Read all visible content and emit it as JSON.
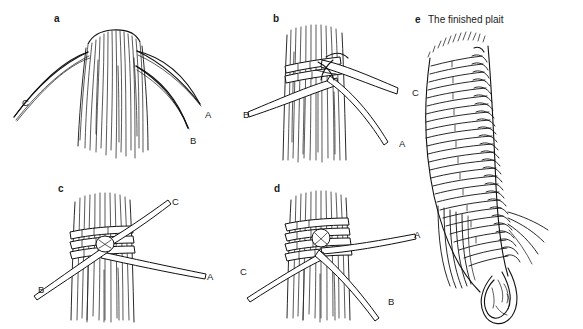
{
  "figure": {
    "background_color": "#ffffff",
    "ink_color": "#111111",
    "type": "instructional-line-drawing"
  },
  "panels": [
    {
      "id": "a",
      "letter": "a",
      "title": "",
      "labels": [
        {
          "text": "C",
          "x": 22,
          "y": 98
        },
        {
          "text": "A",
          "x": 205,
          "y": 110
        },
        {
          "text": "B",
          "x": 190,
          "y": 136
        }
      ]
    },
    {
      "id": "b",
      "letter": "b",
      "title": "",
      "labels": [
        {
          "text": "B",
          "x": 243,
          "y": 110
        },
        {
          "text": "C",
          "x": 412,
          "y": 88
        },
        {
          "text": "A",
          "x": 399,
          "y": 139
        }
      ]
    },
    {
      "id": "c",
      "letter": "c",
      "title": "",
      "labels": [
        {
          "text": "C",
          "x": 172,
          "y": 197
        },
        {
          "text": "A",
          "x": 207,
          "y": 272
        },
        {
          "text": "B",
          "x": 38,
          "y": 285
        }
      ]
    },
    {
      "id": "d",
      "letter": "d",
      "title": "",
      "labels": [
        {
          "text": "A",
          "x": 414,
          "y": 236
        },
        {
          "text": "C",
          "x": 240,
          "y": 272
        },
        {
          "text": "B",
          "x": 388,
          "y": 302
        }
      ]
    },
    {
      "id": "e",
      "letter": "e",
      "title": "The finished plait",
      "labels": []
    }
  ],
  "strand_names": [
    "A",
    "B",
    "C"
  ]
}
